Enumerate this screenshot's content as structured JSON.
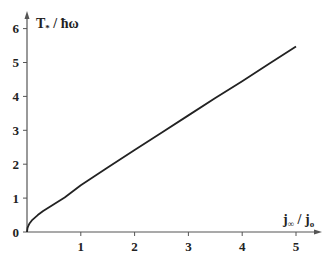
{
  "chart_data": {
    "type": "line",
    "title": "",
    "xlabel": "j∞ / jo",
    "xlabel_main": "j",
    "xlabel_sub": "∞",
    "xlabel_sep": " / j",
    "xlabel_sub2": "o",
    "ylabel": "T* / ħω",
    "ylabel_main": "T",
    "ylabel_sub": "*",
    "ylabel_rest": " / ħω",
    "xlim": [
      0,
      5.45
    ],
    "ylim": [
      0,
      6.5
    ],
    "x_ticks": [
      1,
      2,
      3,
      4,
      5
    ],
    "x_tick_labels": [
      "1",
      "2",
      "3",
      "4",
      "5"
    ],
    "y_ticks": [
      0,
      1,
      2,
      3,
      4,
      5,
      6
    ],
    "y_tick_labels": [
      "0",
      "1",
      "2",
      "3",
      "4",
      "5",
      "6"
    ],
    "grid": false,
    "legend": "none",
    "series": [
      {
        "name": "T*/ħω",
        "x": [
          0,
          0.01,
          0.03,
          0.05,
          0.1,
          0.2,
          0.3,
          0.5,
          0.7,
          1.0,
          1.5,
          2.0,
          2.5,
          3.0,
          3.5,
          4.0,
          4.5,
          5.0
        ],
        "y": [
          0,
          0.12,
          0.2,
          0.26,
          0.36,
          0.5,
          0.62,
          0.82,
          1.02,
          1.38,
          1.9,
          2.42,
          2.93,
          3.44,
          3.95,
          4.45,
          4.96,
          5.47
        ]
      }
    ]
  }
}
